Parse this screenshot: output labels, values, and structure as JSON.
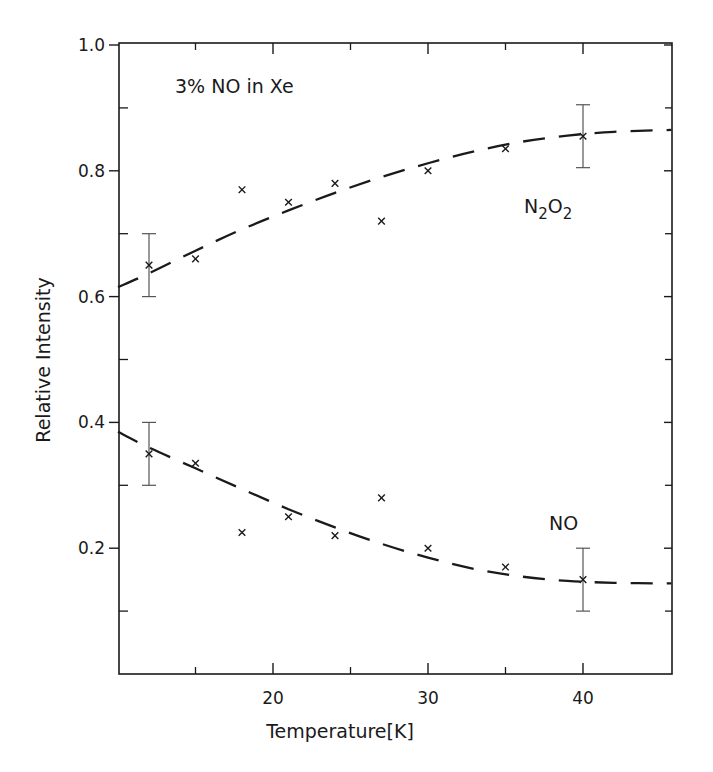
{
  "chart_data": {
    "type": "scatter",
    "title": "3% NO in Xe",
    "xlabel": "Temperature[K]",
    "ylabel": "Relative Intensity",
    "xlim": [
      10,
      45.7
    ],
    "ylim": [
      0,
      1.0
    ],
    "x_ticks_major": [
      20,
      30,
      40
    ],
    "x_ticks_minor": [
      15,
      25,
      35
    ],
    "y_ticks_major": [
      0.2,
      0.4,
      0.6,
      0.8,
      1.0
    ],
    "y_ticks_major_labels": [
      "0.2",
      "0.4",
      "0.6",
      "0.8",
      "1.0"
    ],
    "y_ticks_minor": [
      0.1,
      0.3,
      0.5,
      0.7,
      0.9
    ],
    "grid": false,
    "marker": "x",
    "series": [
      {
        "name": "N2O2",
        "label_main": "N",
        "label_sub1": "2",
        "label_mid": "O",
        "label_sub2": "2",
        "x": [
          12,
          15,
          18,
          21,
          24,
          27,
          30,
          35,
          40
        ],
        "y": [
          0.65,
          0.66,
          0.77,
          0.75,
          0.78,
          0.72,
          0.8,
          0.835,
          0.855
        ],
        "error_bars": [
          {
            "x": 12,
            "low": 0.6,
            "high": 0.7
          },
          {
            "x": 40,
            "low": 0.805,
            "high": 0.905
          }
        ],
        "fit_curve": {
          "style": "dashed",
          "x": [
            10,
            12,
            15,
            18,
            21,
            24,
            27,
            30,
            33,
            36,
            39,
            42,
            45.7
          ],
          "y": [
            0.615,
            0.637,
            0.673,
            0.707,
            0.737,
            0.765,
            0.79,
            0.812,
            0.831,
            0.846,
            0.856,
            0.862,
            0.865
          ]
        }
      },
      {
        "name": "NO",
        "label_main": "NO",
        "x": [
          12,
          15,
          18,
          21,
          24,
          27,
          30,
          35,
          40
        ],
        "y": [
          0.35,
          0.335,
          0.225,
          0.25,
          0.22,
          0.28,
          0.2,
          0.17,
          0.15
        ],
        "error_bars": [
          {
            "x": 12,
            "low": 0.3,
            "high": 0.4
          },
          {
            "x": 40,
            "low": 0.1,
            "high": 0.2
          }
        ],
        "fit_curve": {
          "style": "dashed",
          "x": [
            10,
            12,
            15,
            18,
            21,
            24,
            27,
            30,
            33,
            36,
            39,
            42,
            45.7
          ],
          "y": [
            0.385,
            0.36,
            0.327,
            0.294,
            0.262,
            0.233,
            0.207,
            0.185,
            0.167,
            0.155,
            0.148,
            0.145,
            0.144
          ]
        }
      }
    ]
  },
  "annotations": {
    "title": "3% NO in Xe",
    "n2o2_label": "N2O2",
    "no_label": "NO"
  },
  "colors": {
    "ink": "#1a1a1a",
    "errorbar": "#555555",
    "background": "#ffffff"
  }
}
